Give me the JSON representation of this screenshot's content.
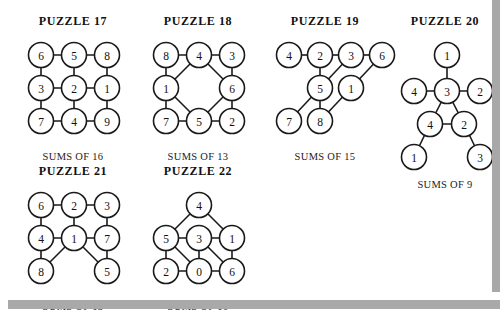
{
  "page": {
    "background_color": "#ffffff",
    "shadow_color": "#a8a8a8",
    "ink_color": "#1a1a1a"
  },
  "puzzles": [
    {
      "id": "puzzle-17",
      "title": "PUZZLE 17",
      "caption": "SUMS OF 16",
      "layout": {
        "left": 18,
        "top": 14,
        "width": 110,
        "svg_w": 104,
        "svg_h": 96
      },
      "nodes": [
        {
          "id": "n1",
          "value": "6",
          "x": 19,
          "y": 19
        },
        {
          "id": "n2",
          "value": "5",
          "x": 52,
          "y": 19
        },
        {
          "id": "n3",
          "value": "8",
          "x": 85,
          "y": 19
        },
        {
          "id": "n4",
          "value": "3",
          "x": 19,
          "y": 52
        },
        {
          "id": "n5",
          "value": "2",
          "x": 52,
          "y": 52
        },
        {
          "id": "n6",
          "value": "1",
          "x": 85,
          "y": 52
        },
        {
          "id": "n7",
          "value": "7",
          "x": 19,
          "y": 85
        },
        {
          "id": "n8",
          "value": "4",
          "x": 52,
          "y": 85
        },
        {
          "id": "n9",
          "value": "9",
          "x": 85,
          "y": 85
        }
      ],
      "edges": [
        [
          "n1",
          "n2"
        ],
        [
          "n2",
          "n3"
        ],
        [
          "n4",
          "n5"
        ],
        [
          "n5",
          "n6"
        ],
        [
          "n7",
          "n8"
        ],
        [
          "n8",
          "n9"
        ],
        [
          "n1",
          "n4"
        ],
        [
          "n4",
          "n7"
        ],
        [
          "n2",
          "n5"
        ],
        [
          "n5",
          "n8"
        ],
        [
          "n3",
          "n6"
        ],
        [
          "n6",
          "n9"
        ]
      ]
    },
    {
      "id": "puzzle-18",
      "title": "PUZZLE 18",
      "caption": "SUMS OF 13",
      "layout": {
        "left": 143,
        "top": 14,
        "width": 110,
        "svg_w": 104,
        "svg_h": 96
      },
      "nodes": [
        {
          "id": "n1",
          "value": "8",
          "x": 19,
          "y": 19
        },
        {
          "id": "n2",
          "value": "4",
          "x": 52,
          "y": 19
        },
        {
          "id": "n3",
          "value": "3",
          "x": 85,
          "y": 19
        },
        {
          "id": "n4",
          "value": "1",
          "x": 19,
          "y": 52
        },
        {
          "id": "n5",
          "value": "6",
          "x": 85,
          "y": 52
        },
        {
          "id": "n6",
          "value": "7",
          "x": 19,
          "y": 85
        },
        {
          "id": "n7",
          "value": "5",
          "x": 52,
          "y": 85
        },
        {
          "id": "n8",
          "value": "2",
          "x": 85,
          "y": 85
        }
      ],
      "edges": [
        [
          "n1",
          "n2"
        ],
        [
          "n2",
          "n3"
        ],
        [
          "n1",
          "n4"
        ],
        [
          "n4",
          "n6"
        ],
        [
          "n3",
          "n5"
        ],
        [
          "n5",
          "n8"
        ],
        [
          "n6",
          "n7"
        ],
        [
          "n7",
          "n8"
        ],
        [
          "n2",
          "n4"
        ],
        [
          "n2",
          "n5"
        ],
        [
          "n4",
          "n7"
        ],
        [
          "n7",
          "n5"
        ]
      ]
    },
    {
      "id": "puzzle-19",
      "title": "PUZZLE 19",
      "caption": "SUMS OF 15",
      "layout": {
        "left": 266,
        "top": 14,
        "width": 118,
        "svg_w": 112,
        "svg_h": 96
      },
      "nodes": [
        {
          "id": "n1",
          "value": "4",
          "x": 19,
          "y": 19
        },
        {
          "id": "n2",
          "value": "2",
          "x": 50,
          "y": 19
        },
        {
          "id": "n3",
          "value": "3",
          "x": 81,
          "y": 19
        },
        {
          "id": "n4",
          "value": "6",
          "x": 112,
          "y": 19
        },
        {
          "id": "n5",
          "value": "5",
          "x": 50,
          "y": 52
        },
        {
          "id": "n6",
          "value": "1",
          "x": 81,
          "y": 52
        },
        {
          "id": "n7",
          "value": "7",
          "x": 19,
          "y": 85
        },
        {
          "id": "n8",
          "value": "8",
          "x": 50,
          "y": 85
        }
      ],
      "edges": [
        [
          "n1",
          "n2"
        ],
        [
          "n2",
          "n3"
        ],
        [
          "n3",
          "n4"
        ],
        [
          "n2",
          "n5"
        ],
        [
          "n3",
          "n5"
        ],
        [
          "n4",
          "n6"
        ],
        [
          "n5",
          "n7"
        ],
        [
          "n5",
          "n8"
        ],
        [
          "n6",
          "n8"
        ]
      ]
    },
    {
      "id": "puzzle-20",
      "title": "PUZZLE 20",
      "caption": "SUMS OF 9",
      "layout": {
        "left": 393,
        "top": 14,
        "width": 104,
        "svg_w": 100,
        "svg_h": 124
      },
      "nodes": [
        {
          "id": "n1",
          "value": "1",
          "x": 50,
          "y": 19
        },
        {
          "id": "n2",
          "value": "4",
          "x": 17,
          "y": 55
        },
        {
          "id": "n3",
          "value": "3",
          "x": 50,
          "y": 55
        },
        {
          "id": "n4",
          "value": "2",
          "x": 83,
          "y": 55
        },
        {
          "id": "n5",
          "value": "4",
          "x": 33,
          "y": 88
        },
        {
          "id": "n6",
          "value": "2",
          "x": 67,
          "y": 88
        },
        {
          "id": "n7",
          "value": "1",
          "x": 17,
          "y": 121
        },
        {
          "id": "n8",
          "value": "3",
          "x": 83,
          "y": 121
        }
      ],
      "edges": [
        [
          "n1",
          "n3"
        ],
        [
          "n2",
          "n3"
        ],
        [
          "n3",
          "n4"
        ],
        [
          "n3",
          "n5"
        ],
        [
          "n3",
          "n6"
        ],
        [
          "n5",
          "n6"
        ],
        [
          "n5",
          "n7"
        ],
        [
          "n6",
          "n8"
        ]
      ]
    },
    {
      "id": "puzzle-21",
      "title": "PUZZLE 21",
      "caption": "SUMS OF 13",
      "layout": {
        "left": 18,
        "top": 164,
        "width": 110,
        "svg_w": 104,
        "svg_h": 96
      },
      "nodes": [
        {
          "id": "n1",
          "value": "6",
          "x": 19,
          "y": 19
        },
        {
          "id": "n2",
          "value": "2",
          "x": 52,
          "y": 19
        },
        {
          "id": "n3",
          "value": "3",
          "x": 85,
          "y": 19
        },
        {
          "id": "n4",
          "value": "4",
          "x": 19,
          "y": 52
        },
        {
          "id": "n5",
          "value": "1",
          "x": 52,
          "y": 52
        },
        {
          "id": "n6",
          "value": "7",
          "x": 85,
          "y": 52
        },
        {
          "id": "n7",
          "value": "8",
          "x": 19,
          "y": 85
        },
        {
          "id": "n8",
          "value": "5",
          "x": 85,
          "y": 85
        }
      ],
      "edges": [
        [
          "n1",
          "n2"
        ],
        [
          "n2",
          "n3"
        ],
        [
          "n1",
          "n4"
        ],
        [
          "n2",
          "n5"
        ],
        [
          "n3",
          "n6"
        ],
        [
          "n4",
          "n5"
        ],
        [
          "n5",
          "n6"
        ],
        [
          "n4",
          "n7"
        ],
        [
          "n5",
          "n7"
        ],
        [
          "n5",
          "n8"
        ],
        [
          "n6",
          "n8"
        ]
      ]
    },
    {
      "id": "puzzle-22",
      "title": "PUZZLE 22",
      "caption": "SUMS OF 10",
      "layout": {
        "left": 143,
        "top": 164,
        "width": 110,
        "svg_w": 104,
        "svg_h": 96
      },
      "nodes": [
        {
          "id": "n1",
          "value": "4",
          "x": 52,
          "y": 19
        },
        {
          "id": "n2",
          "value": "5",
          "x": 19,
          "y": 52
        },
        {
          "id": "n3",
          "value": "3",
          "x": 52,
          "y": 52
        },
        {
          "id": "n4",
          "value": "1",
          "x": 85,
          "y": 52
        },
        {
          "id": "n5",
          "value": "2",
          "x": 19,
          "y": 85
        },
        {
          "id": "n6",
          "value": "0",
          "x": 52,
          "y": 85
        },
        {
          "id": "n7",
          "value": "6",
          "x": 85,
          "y": 85
        }
      ],
      "edges": [
        [
          "n1",
          "n2"
        ],
        [
          "n1",
          "n4"
        ],
        [
          "n2",
          "n3"
        ],
        [
          "n3",
          "n4"
        ],
        [
          "n2",
          "n5"
        ],
        [
          "n3",
          "n6"
        ],
        [
          "n4",
          "n7"
        ],
        [
          "n2",
          "n6"
        ],
        [
          "n3",
          "n7"
        ],
        [
          "n5",
          "n6"
        ],
        [
          "n6",
          "n7"
        ]
      ]
    }
  ]
}
